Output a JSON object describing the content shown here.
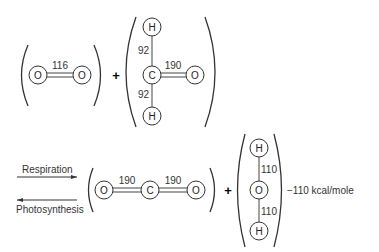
{
  "diagram": {
    "reactants": {
      "o2": {
        "atoms": [
          "O",
          "O"
        ],
        "bond_energy": "116"
      },
      "plus": "+",
      "ch2o": {
        "atoms": [
          "H",
          "C",
          "O",
          "H"
        ],
        "bond_labels": {
          "h_top": "92",
          "c_o": "190",
          "h_bottom": "92"
        }
      }
    },
    "arrows": {
      "forward": "Respiration",
      "reverse": "Photosynthesis"
    },
    "products": {
      "co2": {
        "atoms": [
          "O",
          "C",
          "O"
        ],
        "bond_labels": [
          "190",
          "190"
        ]
      },
      "plus": "+",
      "h2o": {
        "atoms": [
          "H",
          "O",
          "H"
        ],
        "bond_labels": [
          "110",
          "110"
        ]
      }
    },
    "energy": "−110 kcal/mole"
  }
}
